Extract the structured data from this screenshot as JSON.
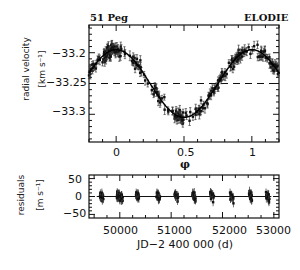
{
  "chart_data": [
    {
      "type": "scatter",
      "title_left": "51 Peg",
      "title_right": "ELODIE",
      "xlabel": "φ",
      "ylabel": "radial velocity",
      "yunit": "[km s⁻¹]",
      "xticks": [
        "0",
        "0.5",
        "1"
      ],
      "xtick_values": [
        0,
        0.5,
        1
      ],
      "yticks": [
        "-33.2",
        "-33.25",
        "-33.3"
      ],
      "ytick_values": [
        -33.2,
        -33.25,
        -33.3
      ],
      "xlim": [
        -0.2,
        1.2
      ],
      "ylim": [
        -33.345,
        -33.155
      ],
      "reference_line": -33.25,
      "fit": "sinusoid, amplitude ~0.056 km/s, max at phase 0 (~-33.195), min at phase 0.5 (~-33.305)",
      "grid": false
    },
    {
      "type": "scatter",
      "xlabel": "JD-2 400 000  (d)",
      "ylabel": "residuals",
      "yunit": "[m s⁻¹]",
      "xticks": [
        "50000",
        "51000",
        "52000",
        "53000"
      ],
      "xtick_values": [
        50000,
        51000,
        52000,
        53000
      ],
      "yticks": [
        "50",
        "0",
        "-50"
      ],
      "ytick_values": [
        50,
        0,
        -50
      ],
      "xlim": [
        49400,
        53100
      ],
      "ylim": [
        -60,
        60
      ],
      "reference_line": 0,
      "season_centers": [
        49650,
        50000,
        50350,
        50750,
        51100,
        51450,
        51800,
        52180,
        52550,
        52880
      ],
      "grid": false
    }
  ],
  "labels": {
    "title_left": "51 Peg",
    "title_right": "ELODIE",
    "top_ylabel": "radial velocity",
    "top_yunit": "[km s⁻¹]",
    "top_xlabel": "φ",
    "top_yticks": [
      "−33.2",
      "−33.25",
      "−33.3"
    ],
    "top_xticks": [
      "0",
      "0.5",
      "1"
    ],
    "bottom_ylabel": "residuals",
    "bottom_yunit": "[m s⁻¹]",
    "bottom_yticks": [
      "50",
      "0",
      "−50"
    ],
    "bottom_xticks": [
      "50000",
      "51000",
      "52000",
      "53000"
    ],
    "bottom_xlabel": "JD−2 400 000  (d)"
  }
}
